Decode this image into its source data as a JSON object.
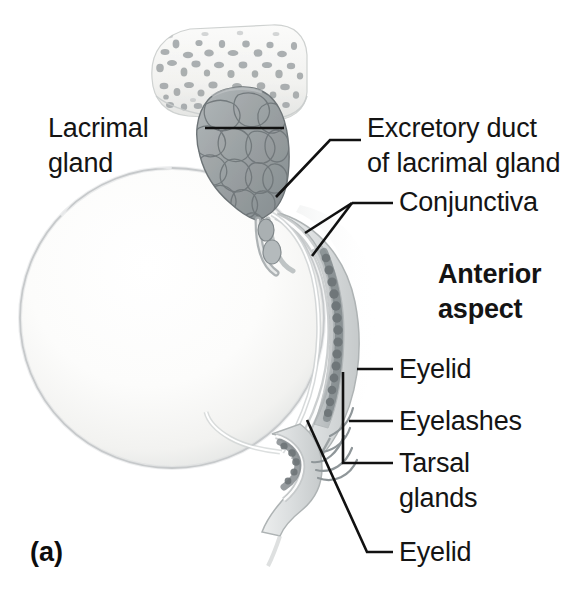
{
  "figure": {
    "letter": "(a)",
    "orientation_note": "Anterior aspect"
  },
  "labels": [
    {
      "id": "lacrimal-gland",
      "lines": [
        "Lacrimal",
        "gland"
      ],
      "side": "left",
      "text_x": 48,
      "line1_baseline": 137,
      "line2_baseline": 172,
      "leader": "M 205,128 L 284,128",
      "bold": false
    },
    {
      "id": "excretory-duct",
      "lines": [
        "Excretory duct",
        "of lacrimal gland"
      ],
      "side": "right",
      "text_x": 367,
      "line1_baseline": 137,
      "line2_baseline": 172,
      "leader": "M 276,197 L 330,140 L 361,140",
      "bold": false
    },
    {
      "id": "conjunctiva",
      "lines": [
        "Conjunctiva"
      ],
      "side": "right",
      "text_x": 399,
      "line1_baseline": 211,
      "leader_main": "M 352,203 L 393,203",
      "leader_fork_a": "M 352,203 L 305,233",
      "leader_fork_b": "M 352,203 L 312,256",
      "bold": false
    },
    {
      "id": "anterior-aspect",
      "lines": [
        "Anterior",
        "aspect"
      ],
      "side": "right",
      "text_x": 438,
      "line1_baseline": 283,
      "line2_baseline": 318,
      "bold": true
    },
    {
      "id": "eyelid-upper",
      "lines": [
        "Eyelid"
      ],
      "side": "right",
      "text_x": 399,
      "line1_baseline": 378,
      "leader": "M 357,369 L 393,369",
      "bold": false
    },
    {
      "id": "eyelashes",
      "lines": [
        "Eyelashes"
      ],
      "side": "right",
      "text_x": 399,
      "line1_baseline": 430,
      "leader": "M 349,421 L 393,421",
      "bold": false
    },
    {
      "id": "tarsal-glands",
      "lines": [
        "Tarsal",
        "glands"
      ],
      "side": "right",
      "text_x": 399,
      "line1_baseline": 472,
      "line2_baseline": 507,
      "leader": "M 343,372 L 343,463 L 393,463",
      "bold": false
    },
    {
      "id": "eyelid-lower",
      "lines": [
        "Eyelid"
      ],
      "side": "right",
      "text_x": 399,
      "line1_baseline": 561,
      "leader": "M 307,420 L 367,552 L 393,552",
      "bold": false
    }
  ],
  "anatomy": {
    "parts": [
      {
        "name": "frontal-bone-spongy",
        "description": "Spongy (trabecular) bone slab at top"
      },
      {
        "name": "lacrimal-gland-body",
        "description": "Lobulated grey gland beneath bone"
      },
      {
        "name": "excretory-ducts",
        "description": "Small ducts descending to conjunctival sac"
      },
      {
        "name": "eyeball",
        "description": "Large pale sphere, sclera"
      },
      {
        "name": "conjunctiva-layers",
        "description": "Thin membrane lining lids and covering eye"
      },
      {
        "name": "upper-eyelid",
        "description": "Upper lid with tarsal plate"
      },
      {
        "name": "tarsal-glands-chain",
        "description": "Beaded row of meibomian glands in tarsal plate"
      },
      {
        "name": "lower-eyelid",
        "description": "Lower lid"
      },
      {
        "name": "eyelashes-hairs",
        "description": "Curving lash hairs at lid margin"
      }
    ]
  },
  "colors": {
    "background": "#ffffff",
    "text": "#141414",
    "leader_line": "#111111",
    "eyeball_fill": "#fbfbfa",
    "eyeball_edge": "#b9bcbd",
    "gland_fill": "#9aa0a2",
    "gland_edge": "#6d7477",
    "bone_fill": "#f4f4f2",
    "bone_pore": "#9b9fa1",
    "lid_fill": "#dcdfe0",
    "tarsal_bead": "#82888b"
  }
}
